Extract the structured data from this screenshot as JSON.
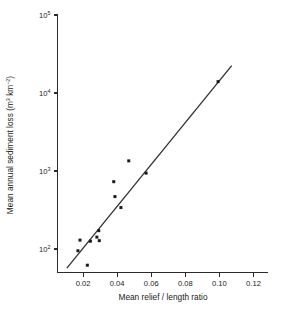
{
  "chart_data": {
    "type": "scatter",
    "title": "",
    "xlabel": "Mean relief / length ratio",
    "ylabel": "Mean annual sediment loss (m³ km⁻²)",
    "ylabel_parts": {
      "main": "Mean annual sediment loss (m",
      "sup1": "3",
      "mid": " km",
      "sup2": "−2",
      "tail": ")"
    },
    "xlabel_text": "Mean relief / length ratio",
    "xscale": "linear",
    "yscale": "log",
    "xlim": [
      0.005,
      0.1285
    ],
    "ylim": [
      50,
      100000
    ],
    "grid": false,
    "legend": null,
    "x_ticks": [
      0.02,
      0.04,
      0.06,
      0.08,
      0.1,
      0.12
    ],
    "x_tick_labels": [
      "0.02",
      "0.04",
      "0.06",
      "0.08",
      "0.10",
      "0.12"
    ],
    "y_ticks": [
      100,
      1000,
      10000,
      100000
    ],
    "y_tick_labels": [
      "10²",
      "10³",
      "10⁴",
      "10⁵"
    ],
    "y_tick_mantissa": "10",
    "y_tick_exponents": [
      "2",
      "3",
      "4",
      "5"
    ],
    "marker": "square",
    "marker_color": "#1a1a1a",
    "line_color": "#2b2b2b",
    "axis_color": "#2b2b2b",
    "background": "#ffffff",
    "points": [
      {
        "x": 0.017,
        "y": 95
      },
      {
        "x": 0.0182,
        "y": 130
      },
      {
        "x": 0.0225,
        "y": 62
      },
      {
        "x": 0.0243,
        "y": 126
      },
      {
        "x": 0.0281,
        "y": 142
      },
      {
        "x": 0.0292,
        "y": 172
      },
      {
        "x": 0.0295,
        "y": 128
      },
      {
        "x": 0.038,
        "y": 730
      },
      {
        "x": 0.0387,
        "y": 470
      },
      {
        "x": 0.0422,
        "y": 340
      },
      {
        "x": 0.0468,
        "y": 1350
      },
      {
        "x": 0.057,
        "y": 940
      },
      {
        "x": 0.0992,
        "y": 14000
      }
    ],
    "trend_line": {
      "x_start": 0.0105,
      "y_start": 57,
      "x_end": 0.1072,
      "y_end": 22500
    }
  },
  "figure": {
    "axis_title_x": "Mean relief / length ratio"
  }
}
